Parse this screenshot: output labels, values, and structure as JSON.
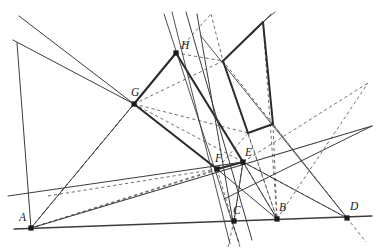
{
  "figure": {
    "type": "geometric-construction-diagram",
    "title": "",
    "background_color": "#ffffff",
    "stroke_color": "#3c3c3c",
    "thick_stroke_color": "#2b2b2b",
    "dashed_stroke_color": "#555555",
    "point_color": "#1a1a1a",
    "width": 380,
    "height": 251
  },
  "points": [
    {
      "id": "A",
      "label": "A",
      "x": 31,
      "y": 228,
      "label_dx": -12,
      "label_dy": -7,
      "marker": true
    },
    {
      "id": "C",
      "label": "C",
      "x": 234,
      "y": 221,
      "label_dx": -1,
      "label_dy": -7,
      "marker": true
    },
    {
      "id": "B",
      "label": "B",
      "x": 277,
      "y": 219,
      "label_dx": 2,
      "label_dy": -8,
      "marker": true
    },
    {
      "id": "D",
      "label": "D",
      "x": 347,
      "y": 218,
      "label_dx": 3,
      "label_dy": -8,
      "marker": true
    },
    {
      "id": "E",
      "label": "E",
      "x": 243,
      "y": 162,
      "label_dx": 2,
      "label_dy": -6,
      "marker": true
    },
    {
      "id": "F",
      "label": "F",
      "x": 217,
      "y": 169,
      "label_dx": -2,
      "label_dy": -7,
      "marker": true
    },
    {
      "id": "G",
      "label": "G",
      "x": 134,
      "y": 104,
      "label_dx": -3,
      "label_dy": -8,
      "marker": true
    },
    {
      "id": "H",
      "label": "H",
      "x": 176,
      "y": 53,
      "label_dx": 5,
      "label_dy": -4,
      "marker": true
    }
  ],
  "unlabeled_vertices": [
    {
      "id": "P1",
      "x": 223,
      "y": 61,
      "note": "right-quad upper-left corner"
    },
    {
      "id": "P2",
      "x": 263,
      "y": 22,
      "note": "right-quad top corner"
    },
    {
      "id": "P3",
      "x": 273,
      "y": 124,
      "note": "right-quad lower-right corner"
    },
    {
      "id": "P4",
      "x": 248,
      "y": 133,
      "note": "right-quad lower-left corner"
    }
  ],
  "solid_lines": [
    {
      "name": "baseline-A-D",
      "x1": 14,
      "y1": 229,
      "x2": 372,
      "y2": 216,
      "weight": 1.3
    },
    {
      "name": "line-A-through-F-E-right",
      "x1": 31,
      "y1": 228,
      "x2": 372,
      "y2": 126,
      "weight": 1.1
    },
    {
      "name": "line-A-through-G-upperleft",
      "x1": 31,
      "y1": 228,
      "x2": 17,
      "y2": 43,
      "weight": 0.0
    },
    {
      "name": "ray-upperleft-1-to-G",
      "x1": 19,
      "y1": 16,
      "x2": 134,
      "y2": 104,
      "weight": 1.0
    },
    {
      "name": "ray-upperleft-2-to-G",
      "x1": 13,
      "y1": 40,
      "x2": 134,
      "y2": 104,
      "weight": 1.0
    },
    {
      "name": "segment-G-H-thick",
      "x1": 134,
      "y1": 104,
      "x2": 176,
      "y2": 53,
      "weight": 2.1
    },
    {
      "name": "segment-G-F-thick",
      "x1": 134,
      "y1": 104,
      "x2": 217,
      "y2": 169,
      "weight": 2.1
    },
    {
      "name": "segment-H-E-thick",
      "x1": 176,
      "y1": 53,
      "x2": 243,
      "y2": 162,
      "weight": 2.1
    },
    {
      "name": "segment-F-E-thick",
      "x1": 217,
      "y1": 169,
      "x2": 243,
      "y2": 162,
      "weight": 2.1
    },
    {
      "name": "quad2-P1-P2-thick",
      "x1": 223,
      "y1": 61,
      "x2": 263,
      "y2": 22,
      "weight": 2.0
    },
    {
      "name": "quad2-P2-P3-thick",
      "x1": 263,
      "y1": 22,
      "x2": 273,
      "y2": 124,
      "weight": 2.0
    },
    {
      "name": "quad2-P3-P4-thick",
      "x1": 273,
      "y1": 124,
      "x2": 248,
      "y2": 133,
      "weight": 2.0
    },
    {
      "name": "quad2-P4-P1-thick",
      "x1": 248,
      "y1": 133,
      "x2": 223,
      "y2": 61,
      "weight": 2.0
    },
    {
      "name": "line-through-H-C-down",
      "x1": 164,
      "y1": 14,
      "x2": 239,
      "y2": 243,
      "weight": 0.9
    },
    {
      "name": "line-through-H-steep",
      "x1": 172,
      "y1": 12,
      "x2": 230,
      "y2": 244,
      "weight": 0.9
    },
    {
      "name": "line-H-down-right-long",
      "x1": 186,
      "y1": 12,
      "x2": 252,
      "y2": 240,
      "weight": 0.0
    },
    {
      "name": "line-P2-upper-extend",
      "x1": 271,
      "y1": 14,
      "x2": 251,
      "y2": 35,
      "weight": 0.9
    },
    {
      "name": "line-diag-C-to-upperright",
      "x1": 197,
      "y1": 14,
      "x2": 233,
      "y2": 222,
      "weight": 0.0
    },
    {
      "name": "line-F-to-B-solid",
      "x1": 217,
      "y1": 169,
      "x2": 277,
      "y2": 219,
      "weight": 1.0
    },
    {
      "name": "line-E-to-C-solid",
      "x1": 243,
      "y1": 162,
      "x2": 234,
      "y2": 221,
      "weight": 1.0
    },
    {
      "name": "line-E-to-B-solid",
      "x1": 243,
      "y1": 162,
      "x2": 277,
      "y2": 219,
      "weight": 1.0
    },
    {
      "name": "line-E-to-D-solid",
      "x1": 243,
      "y1": 162,
      "x2": 347,
      "y2": 218,
      "weight": 0.0
    },
    {
      "name": "line-G-to-A-solid",
      "x1": 134,
      "y1": 104,
      "x2": 31,
      "y2": 228,
      "weight": 0.0
    },
    {
      "name": "line-upper-right-slope",
      "x1": 224,
      "y1": 199,
      "x2": 372,
      "y2": 126,
      "weight": 1.0
    },
    {
      "name": "line-midslope-left-edge",
      "x1": 8,
      "y1": 196,
      "x2": 243,
      "y2": 162,
      "weight": 1.0
    },
    {
      "name": "line-D-to-upper-left",
      "x1": 347,
      "y1": 218,
      "x2": 201,
      "y2": 36,
      "weight": 0.9
    },
    {
      "name": "line-quad2-P2-ray-up",
      "x1": 263,
      "y1": 22,
      "x2": 275,
      "y2": 12,
      "weight": 0.9
    }
  ],
  "dashed_lines": [
    {
      "name": "dash-A-to-G",
      "x1": 31,
      "y1": 228,
      "x2": 134,
      "y2": 104
    },
    {
      "name": "dash-A-to-H",
      "x1": 31,
      "y1": 228,
      "x2": 176,
      "y2": 53
    },
    {
      "name": "dash-A-to-F",
      "x1": 31,
      "y1": 228,
      "x2": 217,
      "y2": 169
    },
    {
      "name": "dash-A-to-E",
      "x1": 31,
      "y1": 228,
      "x2": 243,
      "y2": 162
    },
    {
      "name": "dash-G-to-E",
      "x1": 134,
      "y1": 104,
      "x2": 243,
      "y2": 162
    },
    {
      "name": "dash-G-to-P4",
      "x1": 134,
      "y1": 104,
      "x2": 248,
      "y2": 133
    },
    {
      "name": "dash-H-to-P1",
      "x1": 176,
      "y1": 53,
      "x2": 223,
      "y2": 61
    },
    {
      "name": "dash-H-to-P2-upper",
      "x1": 176,
      "y1": 53,
      "x2": 211,
      "y2": 14
    },
    {
      "name": "dash-P2up-to-P1",
      "x1": 211,
      "y1": 14,
      "x2": 223,
      "y2": 61
    },
    {
      "name": "dash-P1-to-B",
      "x1": 223,
      "y1": 61,
      "x2": 277,
      "y2": 219
    },
    {
      "name": "dash-P2-to-B",
      "x1": 263,
      "y1": 22,
      "x2": 277,
      "y2": 219
    },
    {
      "name": "dash-P4-to-B",
      "x1": 248,
      "y1": 133,
      "x2": 277,
      "y2": 219
    },
    {
      "name": "dash-P3-to-B",
      "x1": 273,
      "y1": 124,
      "x2": 277,
      "y2": 219
    },
    {
      "name": "dash-E-to-B",
      "x1": 243,
      "y1": 162,
      "x2": 277,
      "y2": 219
    },
    {
      "name": "dash-E-to-C",
      "x1": 243,
      "y1": 162,
      "x2": 234,
      "y2": 221
    },
    {
      "name": "dash-F-to-C-down",
      "x1": 217,
      "y1": 169,
      "x2": 240,
      "y2": 247
    },
    {
      "name": "dash-B-to-upper-right",
      "x1": 277,
      "y1": 219,
      "x2": 368,
      "y2": 83
    },
    {
      "name": "dash-D-to-upper-left-long",
      "x1": 347,
      "y1": 218,
      "x2": 223,
      "y2": 61
    },
    {
      "name": "dash-D-down-right",
      "x1": 347,
      "y1": 218,
      "x2": 366,
      "y2": 242
    },
    {
      "name": "dash-E-to-D",
      "x1": 243,
      "y1": 162,
      "x2": 347,
      "y2": 218
    },
    {
      "name": "dash-P4-to-F",
      "x1": 248,
      "y1": 133,
      "x2": 217,
      "y2": 169
    },
    {
      "name": "dash-mid-horizontal-right",
      "x1": 243,
      "y1": 162,
      "x2": 368,
      "y2": 83
    },
    {
      "name": "dash-G-to-P1-long",
      "x1": 134,
      "y1": 104,
      "x2": 223,
      "y2": 61
    },
    {
      "name": "dash-F-low-left",
      "x1": 217,
      "y1": 169,
      "x2": 48,
      "y2": 196
    },
    {
      "name": "dash-P3-low-right",
      "x1": 273,
      "y1": 124,
      "x2": 347,
      "y2": 218
    },
    {
      "name": "dash-C-below",
      "x1": 234,
      "y1": 221,
      "x2": 228,
      "y2": 247
    }
  ],
  "labels": {
    "A": "A",
    "B": "B",
    "C": "C",
    "D": "D",
    "E": "E",
    "F": "F",
    "G": "G",
    "H": "H"
  }
}
